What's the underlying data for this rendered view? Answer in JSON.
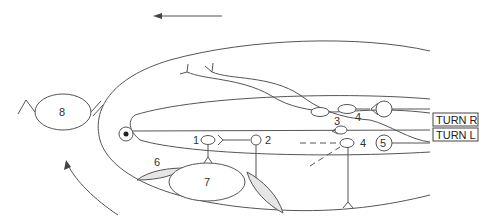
{
  "diagram": {
    "direction_arrow": "leftward",
    "labels": {
      "n1": "1",
      "n2": "2",
      "n3": "3",
      "n4_top": "4",
      "n4_bottom": "4",
      "n5": "5",
      "n6": "6",
      "n7": "7",
      "n8": "8"
    },
    "outputs": {
      "turn_r": "TURN R",
      "turn_l": "TURN L"
    },
    "colors": {
      "stroke": "#555555",
      "fill_shaded": "#e6e6e6",
      "background": "#ffffff"
    }
  }
}
